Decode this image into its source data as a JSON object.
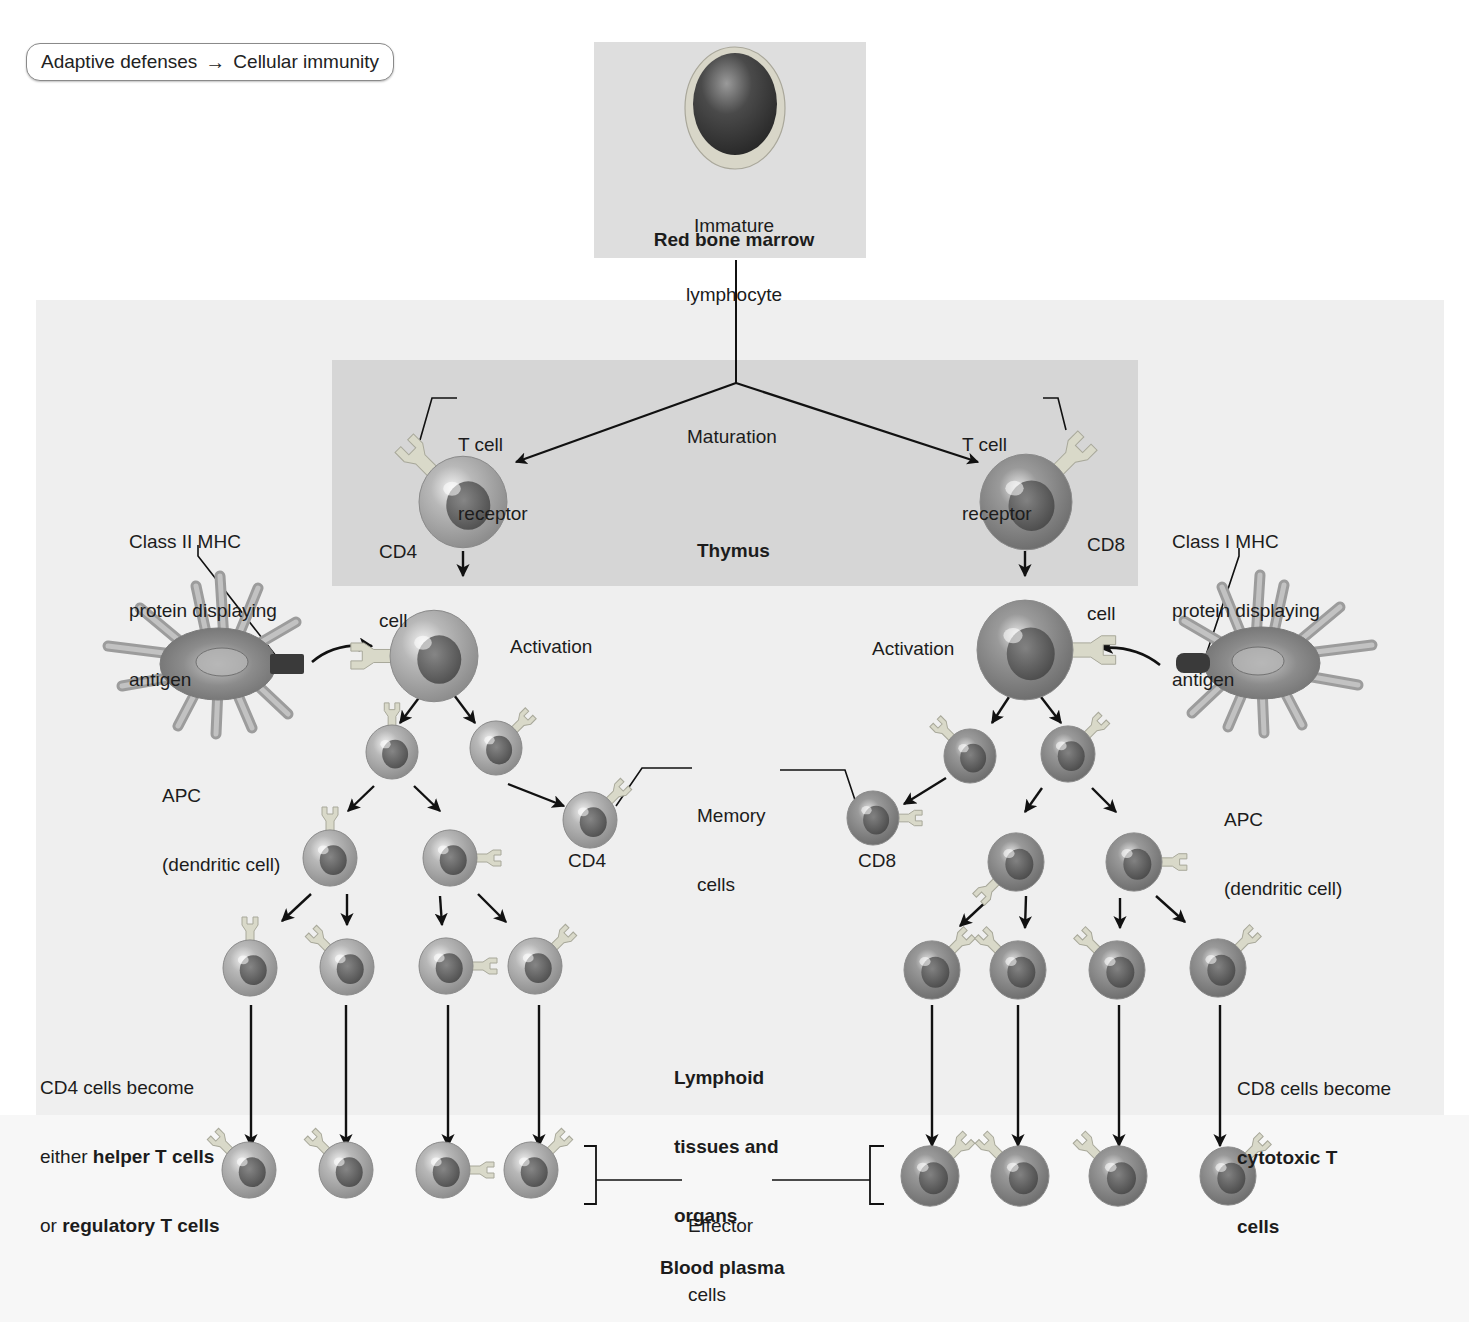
{
  "breadcrumb": {
    "from": "Adaptive defenses",
    "arrow": "→",
    "to": "Cellular immunity"
  },
  "colors": {
    "page_bg": "#ffffff",
    "tissue_panel": "#efefef",
    "marrow_panel": "#dedede",
    "thymus_panel": "#d6d6d6",
    "cell_body": "#a9a9a9",
    "cell_nucleus": "#555555",
    "receptor": "#d9d9c9",
    "apc_body": "#8e8e8e",
    "mhc": "#3a3a3a",
    "line": "#111111"
  },
  "regions": {
    "red_bone_marrow": {
      "label": "Red bone marrow",
      "x": 594,
      "y": 42,
      "w": 272,
      "h": 216
    },
    "thymus": {
      "label": "Thymus",
      "x": 332,
      "y": 360,
      "w": 806,
      "h": 226
    },
    "lymphoid": {
      "label_lines": [
        "Lymphoid",
        "tissues and",
        "organs"
      ],
      "x": 36,
      "y": 300,
      "w": 1408,
      "h": 815
    },
    "blood_plasma": {
      "label": "Blood plasma"
    }
  },
  "labels": {
    "immature_lymphocyte": [
      "Immature",
      "lymphocyte"
    ],
    "maturation": "Maturation",
    "tcr_left": [
      "T cell",
      "receptor"
    ],
    "tcr_right": [
      "T cell",
      "receptor"
    ],
    "cd4_cell": [
      "CD4",
      "cell"
    ],
    "cd8_cell": [
      "CD8",
      "cell"
    ],
    "class2_mhc": [
      "Class II MHC",
      "protein displaying",
      "antigen"
    ],
    "class1_mhc": [
      "Class I MHC",
      "protein displaying",
      "antigen"
    ],
    "activation_left": "Activation",
    "activation_right": "Activation",
    "apc_left": [
      "APC",
      "(dendritic cell)"
    ],
    "apc_right": [
      "APC",
      "(dendritic cell)"
    ],
    "memory_cells": [
      "Memory",
      "cells"
    ],
    "memory_cd4": "CD4",
    "memory_cd8": "CD8",
    "cd4_fate": {
      "line1": "CD4 cells become",
      "line2_pre": "either ",
      "line2_bold": "helper T cells",
      "line3_pre": "or ",
      "line3_bold": "regulatory T cells"
    },
    "cd8_fate": {
      "line1": "CD8 cells become",
      "line2_bold": "cytotoxic T",
      "line3_bold": "cells"
    },
    "effector_cells": [
      "Effector",
      "cells"
    ]
  },
  "cells": {
    "immature": {
      "x": 735,
      "y": 108,
      "r": 50,
      "type": "immature"
    },
    "cd4_naive": {
      "x": 463,
      "y": 502,
      "r": 44,
      "receptor": "upleft"
    },
    "cd8_naive": {
      "x": 1026,
      "y": 502,
      "r": 46,
      "receptor": "upright"
    },
    "cd4_active": {
      "x": 434,
      "y": 656,
      "r": 44,
      "receptor": "left"
    },
    "cd8_active": {
      "x": 1025,
      "y": 650,
      "r": 48,
      "receptor": "right"
    },
    "cd4_gen1": [
      {
        "x": 392,
        "y": 752,
        "r": 26,
        "receptor": "up"
      },
      {
        "x": 496,
        "y": 748,
        "r": 26,
        "receptor": "upright"
      }
    ],
    "cd8_gen1": [
      {
        "x": 970,
        "y": 756,
        "r": 26,
        "receptor": "upleft"
      },
      {
        "x": 1068,
        "y": 754,
        "r": 27,
        "receptor": "upright"
      }
    ],
    "cd4_memory": {
      "x": 590,
      "y": 820,
      "r": 27,
      "receptor": "upright"
    },
    "cd8_memory": {
      "x": 873,
      "y": 818,
      "r": 26,
      "receptor": "right"
    },
    "cd4_gen2": [
      {
        "x": 330,
        "y": 858,
        "r": 27,
        "receptor": "up"
      },
      {
        "x": 450,
        "y": 858,
        "r": 27,
        "receptor": "right"
      }
    ],
    "cd8_gen2": [
      {
        "x": 1016,
        "y": 862,
        "r": 28,
        "receptor": "downleft"
      },
      {
        "x": 1134,
        "y": 862,
        "r": 28,
        "receptor": "right"
      }
    ],
    "cd4_gen3": [
      {
        "x": 250,
        "y": 968,
        "r": 27,
        "receptor": "up"
      },
      {
        "x": 347,
        "y": 967,
        "r": 27,
        "receptor": "upleft"
      },
      {
        "x": 446,
        "y": 966,
        "r": 27,
        "receptor": "right"
      },
      {
        "x": 535,
        "y": 966,
        "r": 27,
        "receptor": "upright"
      }
    ],
    "cd8_gen3": [
      {
        "x": 932,
        "y": 970,
        "r": 28,
        "receptor": "upright"
      },
      {
        "x": 1018,
        "y": 970,
        "r": 28,
        "receptor": "upleft"
      },
      {
        "x": 1117,
        "y": 970,
        "r": 28,
        "receptor": "upleft"
      },
      {
        "x": 1218,
        "y": 968,
        "r": 28,
        "receptor": "upright"
      }
    ],
    "cd4_effectors": [
      {
        "x": 249,
        "y": 1170,
        "r": 27,
        "receptor": "upleft"
      },
      {
        "x": 346,
        "y": 1170,
        "r": 27,
        "receptor": "upleft"
      },
      {
        "x": 443,
        "y": 1170,
        "r": 27,
        "receptor": "right"
      },
      {
        "x": 531,
        "y": 1170,
        "r": 27,
        "receptor": "upright"
      }
    ],
    "cd8_effectors": [
      {
        "x": 930,
        "y": 1176,
        "r": 29,
        "receptor": "upright"
      },
      {
        "x": 1020,
        "y": 1176,
        "r": 29,
        "receptor": "upleft"
      },
      {
        "x": 1118,
        "y": 1176,
        "r": 29,
        "receptor": "upleft"
      },
      {
        "x": 1228,
        "y": 1176,
        "r": 28,
        "receptor": "upright"
      }
    ]
  },
  "apcs": {
    "left": {
      "x": 218,
      "y": 664,
      "mhc_x": 282,
      "mhc_y": 660,
      "mirror": false
    },
    "right": {
      "x": 1262,
      "y": 663,
      "mhc_x": 1198,
      "mhc_y": 661,
      "mirror": true
    }
  },
  "arrows": {
    "straight": [
      [
        463,
        551,
        463,
        576
      ],
      [
        1025,
        551,
        1025,
        576
      ],
      [
        421,
        695,
        400,
        723
      ],
      [
        454,
        695,
        475,
        723
      ],
      [
        1009,
        697,
        992,
        723
      ],
      [
        1041,
        697,
        1061,
        723
      ],
      [
        508,
        784,
        564,
        806
      ],
      [
        946,
        778,
        904,
        804
      ],
      [
        374,
        786,
        348,
        811
      ],
      [
        414,
        786,
        440,
        811
      ],
      [
        1042,
        788,
        1025,
        812
      ],
      [
        1092,
        788,
        1116,
        812
      ],
      [
        311,
        894,
        282,
        921
      ],
      [
        347,
        894,
        347,
        925
      ],
      [
        440,
        896,
        442,
        925
      ],
      [
        478,
        894,
        506,
        922
      ],
      [
        990,
        898,
        960,
        926
      ],
      [
        1026,
        896,
        1025,
        928
      ],
      [
        1120,
        898,
        1120,
        928
      ],
      [
        1156,
        896,
        1185,
        922
      ],
      [
        251,
        1005,
        251,
        1146
      ],
      [
        346,
        1005,
        346,
        1146
      ],
      [
        448,
        1005,
        448,
        1146
      ],
      [
        539,
        1005,
        539,
        1146
      ],
      [
        932,
        1005,
        932,
        1146
      ],
      [
        1018,
        1005,
        1018,
        1146
      ],
      [
        1119,
        1005,
        1119,
        1146
      ],
      [
        1220,
        1005,
        1220,
        1146
      ]
    ],
    "curved": [
      {
        "d": "M 312 662 Q 335 642 372 646"
      },
      {
        "d": "M 1160 665 Q 1135 645 1100 648"
      }
    ],
    "maturation": {
      "stem": [
        736,
        260,
        736,
        383
      ],
      "left": [
        736,
        383,
        516,
        462
      ],
      "right": [
        736,
        383,
        978,
        462
      ]
    }
  },
  "leaders": [
    {
      "points": "457,398 432,398 420,440"
    },
    {
      "points": "1043,398 1058,398 1066,430"
    },
    {
      "points": "198,545 198,556 276,656"
    },
    {
      "points": "1239,548 1239,556 1206,655"
    },
    {
      "points": "692,768 642,768 616,806"
    },
    {
      "points": "780,770 845,770 857,806"
    }
  ],
  "brackets": {
    "left": {
      "points": "584,1146 596,1146 596,1204 584,1204",
      "line": [
        596,
        1180,
        682,
        1180
      ]
    },
    "right": {
      "points": "884,1146 870,1146 870,1204 884,1204",
      "line": [
        772,
        1180,
        870,
        1180
      ]
    }
  }
}
